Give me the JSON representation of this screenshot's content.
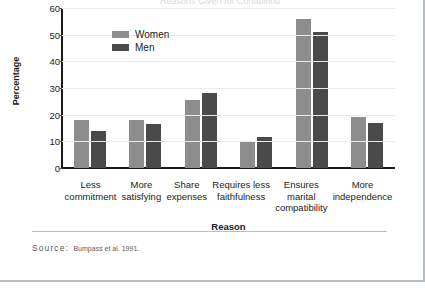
{
  "page": {
    "title_clipped": "Reasons Given for Cohabiting"
  },
  "chart_data": {
    "type": "bar",
    "title": "",
    "xlabel": "Reason",
    "ylabel": "Percentage",
    "ylim": [
      0,
      60
    ],
    "yticks": [
      0,
      10,
      20,
      30,
      40,
      50,
      60
    ],
    "grid": true,
    "legend_position": "inside-top-left",
    "categories": [
      "Less\ncommitment",
      "More\nsatisfying",
      "Share\nexpenses",
      "Requires less\nfaithfulness",
      "Ensures\nmarital\ncompatibility",
      "More\nindependence"
    ],
    "series": [
      {
        "name": "Women",
        "color": "#8d8d8d",
        "values": [
          18,
          18,
          25.5,
          10,
          56,
          19
        ]
      },
      {
        "name": "Men",
        "color": "#4a4a4a",
        "values": [
          14,
          16.5,
          28,
          11.5,
          51,
          17
        ]
      }
    ]
  },
  "source": {
    "label": "Source:",
    "text": "Bumpass et al. 1991."
  }
}
